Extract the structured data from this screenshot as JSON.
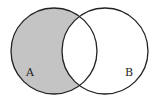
{
  "diagram": {
    "type": "venn",
    "shaded_region": "A minus B",
    "colors": {
      "shade": "#c4c4c4",
      "stroke": "#222222",
      "background": "#ffffff"
    },
    "sets": [
      {
        "label": "A",
        "cx": 54,
        "cy": 51,
        "r": 43,
        "label_x": 26,
        "label_y": 76
      },
      {
        "label": "B",
        "cx": 105,
        "cy": 51,
        "r": 43,
        "label_x": 125,
        "label_y": 76
      }
    ]
  }
}
